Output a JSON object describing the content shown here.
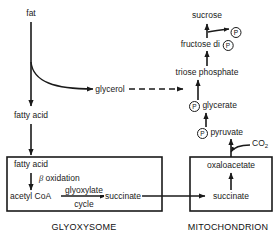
{
  "diagram": {
    "line_color": "#1a1a1a",
    "text_color": "#1a1a1a",
    "background": "#ffffff"
  },
  "nodes": {
    "fat": "fat",
    "glycerol": "glycerol",
    "fatty_acid_outer": "fatty acid",
    "fatty_acid_inner": "fatty acid",
    "beta_oxidation": "oxidation",
    "beta_symbol": "β",
    "acetyl_coa": "acetyl CoA",
    "glyoxylate": "glyoxylate",
    "cycle": "cycle",
    "succinate_glyox": "succinate",
    "succinate_mito": "succinate",
    "oxaloacetate": "oxaloacetate",
    "co2": "CO",
    "co2_sub": "2",
    "p_pyruvate": "pyruvate",
    "p_glycerate": "glycerate",
    "triose_phosphate": "triose phosphate",
    "fructose_di": "fructose di",
    "sucrose": "sucrose",
    "phosphate_symbol": "P"
  },
  "organelles": {
    "glyoxysome": "GLYOXYSOME",
    "mitochondrion": "MITOCHONDRION"
  }
}
